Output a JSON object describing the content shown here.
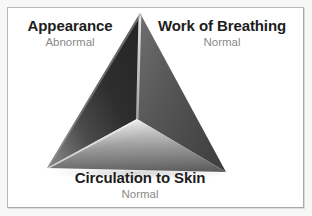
{
  "figure": {
    "name": "pediatric-assessment-triangle",
    "frame_border_color": "#b9b9b9",
    "background_color": "#ffffff",
    "page_background_color": "#f7f7f7"
  },
  "colors": {
    "title_text": "#1d1d1d",
    "subtitle_text": "#8a8a8a",
    "pyramid_left_face_dark": "#2f2f2f",
    "pyramid_left_face_light": "#6e6e6e",
    "pyramid_right_face_dark": "#4a4a4a",
    "pyramid_right_face_light": "#7d7d7d",
    "pyramid_front_face_dark": "#5c5c5c",
    "pyramid_front_face_light": "#d8d8d8",
    "pyramid_ridge_highlight": "#c6c6c6"
  },
  "labels": {
    "appearance": {
      "title": "Appearance",
      "status": "Abnormal"
    },
    "work_of_breathing": {
      "title": "Work of Breathing",
      "status": "Normal"
    },
    "circulation": {
      "title": "Circulation to Skin",
      "status": "Normal"
    }
  },
  "pyramid_geometry": {
    "apex": [
      140,
      13
    ],
    "bottom_left": [
      47,
      168
    ],
    "bottom_right": [
      226,
      172
    ],
    "center_vertex": [
      137,
      119
    ]
  }
}
